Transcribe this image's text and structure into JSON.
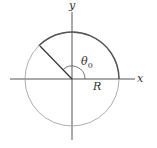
{
  "diagram": {
    "axis_x_label": "x",
    "axis_y_label": "y",
    "angle_label": "θ",
    "angle_subscript": "0",
    "radius_label": "R",
    "colors": {
      "stroke": "#555555",
      "thin": "#888888",
      "text": "#333333"
    }
  }
}
